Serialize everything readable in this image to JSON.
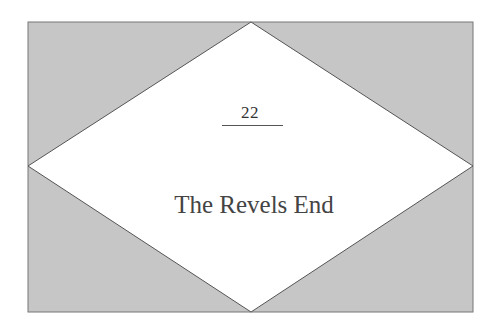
{
  "chapter": {
    "number": "22",
    "title": "The Revels End"
  },
  "colors": {
    "background": "#ffffff",
    "panel_fill": "#c6c6c6",
    "diamond_fill": "#ffffff",
    "stroke": "#666666"
  }
}
